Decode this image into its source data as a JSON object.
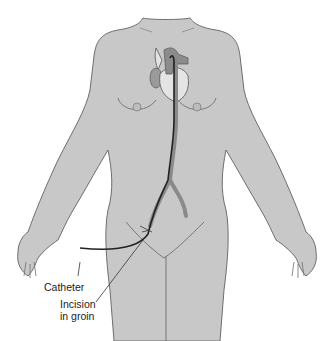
{
  "figure": {
    "labels": {
      "catheter": "Catheter",
      "incision_line1": "Incision",
      "incision_line2": "in groin"
    },
    "colors": {
      "skin": "#c8c8c8",
      "outline": "#6e6e6e",
      "catheter": "#222222",
      "artery": "#8a8a8a",
      "heart": "#e4e4e4"
    }
  }
}
